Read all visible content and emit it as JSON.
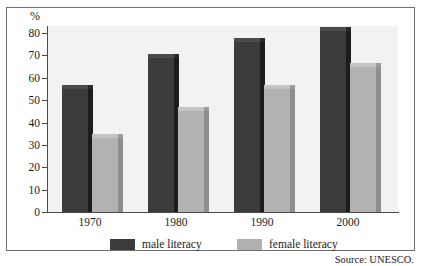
{
  "chart_data": {
    "type": "bar",
    "title": "",
    "subtitle": "",
    "xlabel": "",
    "ylabel": "%",
    "categories": [
      "1970",
      "1980",
      "1990",
      "2000"
    ],
    "series": [
      {
        "name": "male literacy",
        "values": [
          55,
          69,
          76,
          81
        ],
        "color": "#3b3b3b"
      },
      {
        "name": "female literacy",
        "values": [
          33,
          45,
          55,
          65
        ],
        "color": "#b2b2b2"
      }
    ],
    "ylim": [
      0,
      80
    ],
    "yticks": [
      0,
      10,
      20,
      30,
      40,
      50,
      60,
      70,
      80
    ],
    "ytick_labels": [
      "0",
      "10",
      "20",
      "30",
      "40",
      "50",
      "60",
      "70",
      "80"
    ],
    "grid": false,
    "legend_position": "bottom",
    "style": "3d-bars",
    "plot_background": "#f2f2f0",
    "axis_color": "#4a4a4a"
  },
  "legend": {
    "items": [
      {
        "label": "male literacy",
        "swatch": "male-swatch"
      },
      {
        "label": "female literacy",
        "swatch": "female-swatch"
      }
    ]
  },
  "footer": {
    "source": "Source: UNESCO."
  }
}
